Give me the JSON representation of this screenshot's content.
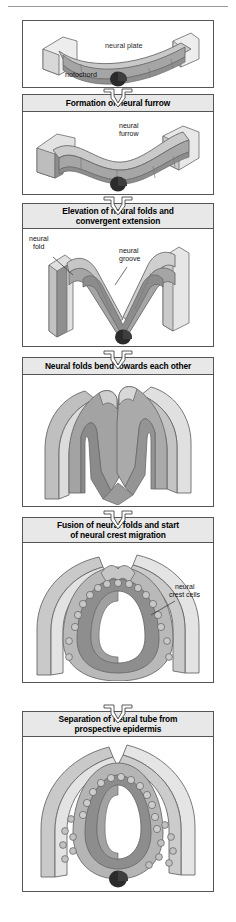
{
  "figure": {
    "title_semantic": "neurulation-stages-flowchart",
    "page_width": 236,
    "page_height": 922
  },
  "palette": {
    "header_fill": "#e8e8e8",
    "border": "#555555",
    "page_bg": "#ffffff",
    "epidermis_light": "#cfcfcf",
    "epidermis_lighter": "#e3e3e3",
    "neural_mid": "#a8a8a8",
    "neural_dark": "#8a8a8a",
    "notochord": "#2b2b2b",
    "crest_cell": "#bdbdbd"
  },
  "stages": [
    {
      "id": "stage-1",
      "header": null,
      "labels": [
        {
          "name": "label-neural-plate",
          "text": "neural plate"
        },
        {
          "name": "label-notochord",
          "text": "notochord"
        }
      ]
    },
    {
      "id": "stage-2",
      "header": "Formation of neural furrow",
      "labels": [
        {
          "name": "label-neural-furrow",
          "text": "neural",
          "text2": "furrow"
        }
      ]
    },
    {
      "id": "stage-3",
      "header": "Elevation of neural folds and convergent extension",
      "header_line1": "Elevation of neural folds and",
      "header_line2": "convergent extension",
      "labels": [
        {
          "name": "label-neural-fold",
          "text": "neural",
          "text2": "fold"
        },
        {
          "name": "label-neural-groove",
          "text": "neural",
          "text2": "groove"
        }
      ]
    },
    {
      "id": "stage-4",
      "header": "Neural folds bend towards each other",
      "header_line1": "Neural folds bend towards each other",
      "header_line2": "",
      "labels": []
    },
    {
      "id": "stage-5",
      "header": "Fusion of neural folds and start of neural crest migration",
      "header_line1": "Fusion of neural folds and start",
      "header_line2": "of neural crest migration",
      "labels": [
        {
          "name": "label-neural-crest-cells",
          "text": "neural",
          "text2": "crest cells"
        }
      ]
    },
    {
      "id": "stage-6",
      "header": "Separation of neural tube from prospective epidermis",
      "header_line1": "Separation of neural tube from",
      "header_line2": "prospective epidermis",
      "labels": []
    }
  ],
  "icons": {
    "flow_arrow": "down-arrow-icon"
  }
}
